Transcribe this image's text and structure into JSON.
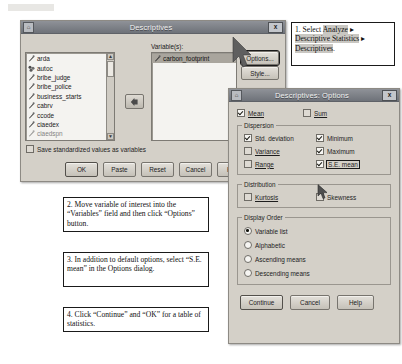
{
  "descriptives_dialog": {
    "title": "Descriptives",
    "close_label": "x",
    "source_list_label": "",
    "variables_label": "Variable(s):",
    "source_variables": [
      "arda",
      "autoc",
      "bribe_judge",
      "bribe_police",
      "business_starts",
      "cabrv",
      "ccode",
      "ciaedex",
      "ciaedspn"
    ],
    "selected_variables": [
      "carbon_footprint"
    ],
    "move_arrow_icon": "left-arrow-icon",
    "side_buttons": [
      "Options...",
      "Style..."
    ],
    "save_standardized_label": "Save standardized values as variables",
    "save_standardized_checked": false,
    "bottom_buttons": [
      "OK",
      "Paste",
      "Reset",
      "Cancel",
      "Help"
    ]
  },
  "options_dialog": {
    "title": "Descriptives: Options",
    "close_label": "x",
    "top_checks": [
      {
        "label": "Mean",
        "checked": true
      },
      {
        "label": "Sum",
        "checked": false
      }
    ],
    "dispersion": {
      "group_label": "Dispersion",
      "items": [
        {
          "label": "Std. deviation",
          "checked": true
        },
        {
          "label": "Minimum",
          "checked": true
        },
        {
          "label": "Variance",
          "checked": false
        },
        {
          "label": "Maximum",
          "checked": true
        },
        {
          "label": "Range",
          "checked": false
        },
        {
          "label": "S.E. mean",
          "checked": true,
          "highlighted": true
        }
      ]
    },
    "distribution": {
      "group_label": "Distribution",
      "items": [
        {
          "label": "Kurtosis",
          "checked": false
        },
        {
          "label": "Skewness",
          "checked": false
        }
      ]
    },
    "display_order": {
      "group_label": "Display Order",
      "options": [
        {
          "label": "Variable list",
          "selected": true
        },
        {
          "label": "Alphabetic",
          "selected": false
        },
        {
          "label": "Ascending means",
          "selected": false
        },
        {
          "label": "Descending means",
          "selected": false
        }
      ]
    },
    "bottom_buttons": [
      "Continue",
      "Cancel",
      "Help"
    ]
  },
  "annotations": [
    {
      "id": "step-1",
      "lines": [
        {
          "prefix": "1. Select ",
          "highlight": "Analyze",
          "suffix": " ▸"
        },
        {
          "prefix": "",
          "highlight": "Descriptive Statistics",
          "suffix": " ▸"
        },
        {
          "prefix": "",
          "highlight": "Descriptives",
          "suffix": "."
        }
      ]
    },
    {
      "id": "step-2",
      "text": "2. Move variable of interest into the “Variables” field and then click “Options” button."
    },
    {
      "id": "step-3",
      "text": "3. In addition to default options, select “S.E. mean” in the Options dialog."
    },
    {
      "id": "step-4",
      "text": "4. Click “Continue” and “OK” for a table of statistics."
    }
  ]
}
